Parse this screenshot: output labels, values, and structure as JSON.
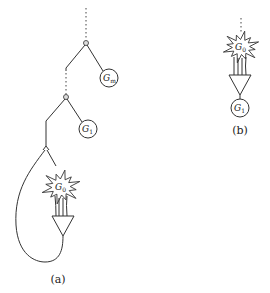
{
  "figure": {
    "panel_a": {
      "caption": "(a)",
      "nodes": {
        "gm": {
          "base": "G",
          "sub": "m"
        },
        "g1": {
          "base": "G",
          "sub": "1"
        },
        "g0": {
          "base": "G",
          "sub": "0"
        }
      }
    },
    "panel_b": {
      "caption": "(b)",
      "nodes": {
        "g0": {
          "base": "G",
          "sub": "0"
        },
        "g1": {
          "base": "G",
          "sub": "1"
        }
      }
    }
  }
}
